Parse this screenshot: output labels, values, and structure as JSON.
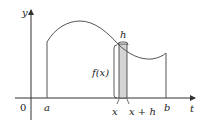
{
  "diagram": {
    "axes": {
      "y_label": "y",
      "x_label": "t",
      "origin_label": "0"
    },
    "points": {
      "a": "a",
      "b": "b",
      "x": "x",
      "x_plus_h": "x + h"
    },
    "annotations": {
      "width_label": "h",
      "height_label": "f(x)"
    },
    "colors": {
      "curve": "#555555",
      "axis": "#333333",
      "strip_fill": "#d4d4d4"
    }
  }
}
